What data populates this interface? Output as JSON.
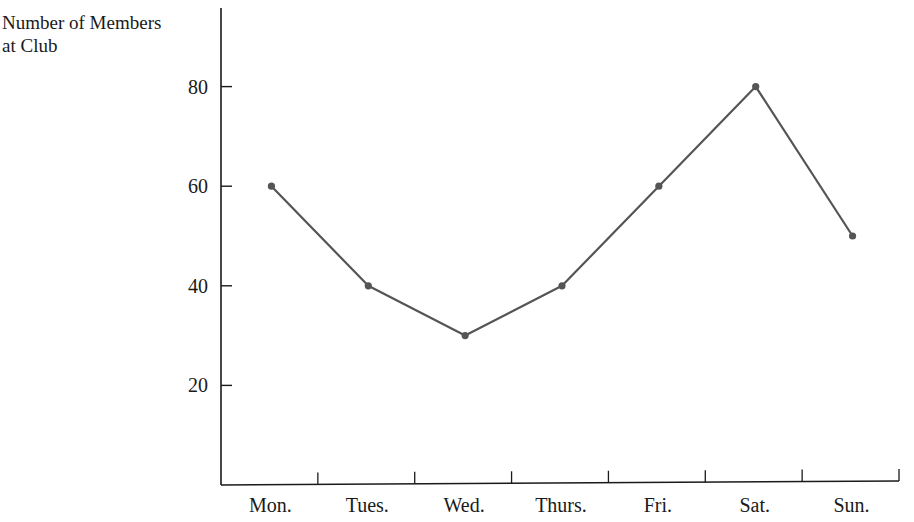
{
  "chart_data": {
    "type": "line",
    "title": "",
    "xlabel": "",
    "ylabel": "Number of Members at Club",
    "ylabel_lines": [
      "Number of Members",
      "at Club"
    ],
    "categories": [
      "Mon.",
      "Tues.",
      "Wed.",
      "Thurs.",
      "Fri.",
      "Sat.",
      "Sun."
    ],
    "values": [
      60,
      40,
      30,
      40,
      60,
      80,
      50
    ],
    "yticks": [
      20,
      40,
      60,
      80
    ],
    "ylim": [
      0,
      100
    ],
    "grid": false,
    "legend": null,
    "line_color": "#555555",
    "marker": "dot"
  }
}
